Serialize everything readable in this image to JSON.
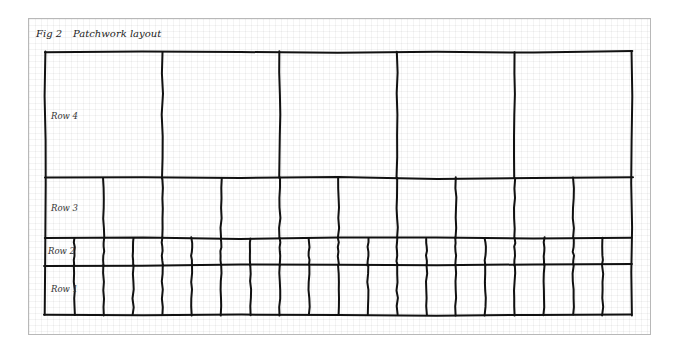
{
  "figure": {
    "label": "Fig 2",
    "title": "Patchwork layout"
  },
  "rows": [
    {
      "label": "Row 4",
      "cells": 5,
      "top": 52,
      "bottom": 178
    },
    {
      "label": "Row 3",
      "cells": 10,
      "top": 178,
      "bottom": 238
    },
    {
      "label": "Row 2",
      "cells": 20,
      "top": 238,
      "bottom": 265
    },
    {
      "label": "Row 1",
      "cells": 20,
      "top": 265,
      "bottom": 315
    }
  ],
  "grid": {
    "left": 45,
    "right": 632,
    "stroke_color": "#111111"
  }
}
